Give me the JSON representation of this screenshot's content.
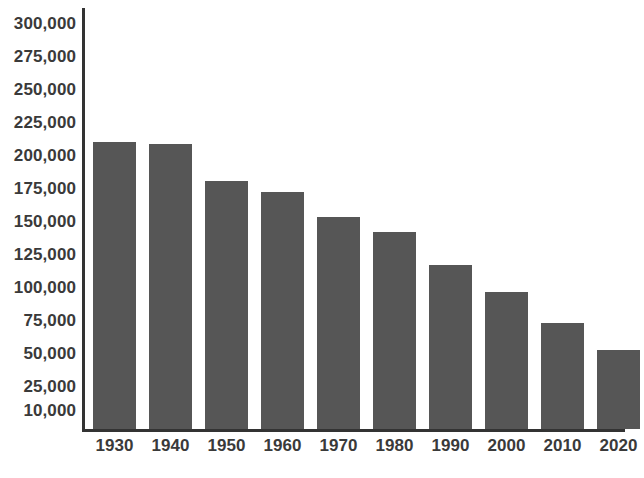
{
  "chart_data": {
    "type": "bar",
    "title": "",
    "subtitle": "",
    "xlabel": "",
    "ylabel": "",
    "categories": [
      "1930",
      "1940",
      "1950",
      "1960",
      "1970",
      "1980",
      "1990",
      "2000",
      "2010",
      "2020"
    ],
    "values": [
      210000,
      208000,
      180000,
      172000,
      153000,
      142000,
      117000,
      96000,
      73000,
      52000
    ],
    "series": [
      {
        "name": "",
        "values": [
          210000,
          208000,
          180000,
          172000,
          153000,
          142000,
          117000,
          96000,
          73000,
          52000
        ]
      }
    ],
    "ylim": [
      10000,
      300000
    ],
    "ytick_labels": [
      "300,000",
      "275,000",
      "250,000",
      "225,000",
      "200,000",
      "175,000",
      "150,000",
      "125,000",
      "100,000",
      "75,000",
      "50,000",
      "25,000",
      "10,000"
    ],
    "ytick_values": [
      300000,
      275000,
      250000,
      225000,
      200000,
      175000,
      150000,
      125000,
      100000,
      75000,
      50000,
      25000,
      10000
    ],
    "xtick_labels": [
      "1930",
      "1940",
      "1950",
      "1960",
      "1970",
      "1980",
      "1990",
      "2000",
      "2010",
      "2020"
    ],
    "grid": false,
    "legend": false,
    "legend_position": "none",
    "annotations": [],
    "colors": {
      "bar": "#565656",
      "axis": "#333333",
      "tick_label": "#3a3a3a",
      "background": "#ffffff"
    }
  }
}
